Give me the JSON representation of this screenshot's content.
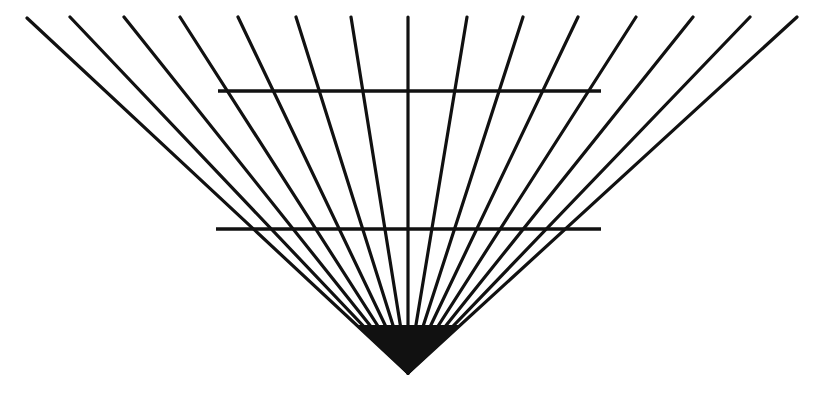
{
  "figure": {
    "background_color": "#ffffff",
    "stroke_color": "#111111",
    "canvas": {
      "width": 831,
      "height": 394
    }
  },
  "chart_data": {
    "type": "scatter",
    "subtitle": "",
    "xlabel": "",
    "ylabel": "",
    "xlim": [
      0,
      831
    ],
    "ylim": [
      394,
      0
    ],
    "grid": false,
    "legend": null,
    "annotations": [],
    "apex": {
      "x": 408,
      "y": 373
    },
    "ray_count": 15,
    "ray_top_y": 17,
    "ray_stroke_width": 3.2,
    "ray_top_x": [
      27,
      70,
      124,
      180,
      238,
      296,
      351,
      408,
      467,
      523,
      578,
      636,
      693,
      750,
      797
    ],
    "rays": [
      {
        "index": 1,
        "x1": 27,
        "y1": 18,
        "x2": 408,
        "y2": 373
      },
      {
        "index": 2,
        "x1": 70,
        "y1": 17,
        "x2": 408,
        "y2": 373
      },
      {
        "index": 3,
        "x1": 124,
        "y1": 17,
        "x2": 408,
        "y2": 373
      },
      {
        "index": 4,
        "x1": 180,
        "y1": 17,
        "x2": 408,
        "y2": 373
      },
      {
        "index": 5,
        "x1": 238,
        "y1": 17,
        "x2": 408,
        "y2": 373
      },
      {
        "index": 6,
        "x1": 296,
        "y1": 17,
        "x2": 408,
        "y2": 373
      },
      {
        "index": 7,
        "x1": 351,
        "y1": 17,
        "x2": 408,
        "y2": 373
      },
      {
        "index": 8,
        "x1": 408,
        "y1": 17,
        "x2": 408,
        "y2": 373
      },
      {
        "index": 9,
        "x1": 467,
        "y1": 17,
        "x2": 408,
        "y2": 373
      },
      {
        "index": 10,
        "x1": 523,
        "y1": 17,
        "x2": 408,
        "y2": 373
      },
      {
        "index": 11,
        "x1": 578,
        "y1": 17,
        "x2": 408,
        "y2": 373
      },
      {
        "index": 12,
        "x1": 636,
        "y1": 17,
        "x2": 408,
        "y2": 373
      },
      {
        "index": 13,
        "x1": 693,
        "y1": 17,
        "x2": 408,
        "y2": 373
      },
      {
        "index": 14,
        "x1": 750,
        "y1": 17,
        "x2": 408,
        "y2": 373
      },
      {
        "index": 15,
        "x1": 797,
        "y1": 17,
        "x2": 408,
        "y2": 373
      }
    ],
    "horizontal_count": 2,
    "horizontal_stroke_width": 3.4,
    "horizontals": [
      {
        "index": 1,
        "label": "upper-horizontal",
        "x1": 218,
        "y1": 91,
        "x2": 601,
        "y2": 91
      },
      {
        "index": 2,
        "label": "lower-horizontal",
        "x1": 216,
        "y1": 229,
        "x2": 601,
        "y2": 229
      }
    ]
  }
}
